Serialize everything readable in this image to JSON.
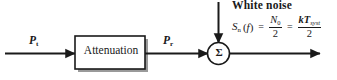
{
  "diagram": {
    "type": "signal-flow-block-diagram",
    "stroke_color": "#1a1a1a",
    "background_color": "#ffffff",
    "noise": {
      "title": "White noise",
      "formula": {
        "lhs_symbol": "S",
        "lhs_subscript": "n",
        "lhs_argument": "f",
        "lhs_full": "S_n(f)",
        "equals_1": "=",
        "term1_numerator": "N",
        "term1_numerator_subscript": "0",
        "term1_denominator": "2",
        "equals_2": "=",
        "term2_numerator_k": "k",
        "term2_numerator_T": "T",
        "term2_numerator_subscript": "syst",
        "term2_denominator": "2",
        "plain_text": "S_n(f) = N_0/2 = kT_syst/2"
      }
    },
    "input": {
      "label_symbol": "P",
      "label_subscript": "t",
      "label_full": "P_t"
    },
    "block": {
      "label": "Attenuation"
    },
    "middle": {
      "label_symbol": "P",
      "label_subscript": "r",
      "label_full": "P_r"
    },
    "summer": {
      "symbol": "Σ",
      "name": "summation-node"
    }
  }
}
